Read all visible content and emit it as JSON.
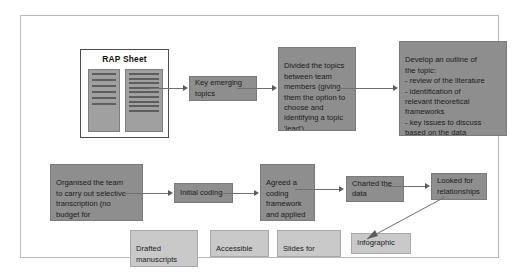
{
  "diagram": {
    "colors": {
      "node_dark": "#8e8e8e",
      "node_light": "#c9c9c9",
      "connector": "#6f6f6f",
      "frame_border": "#b9b9b9",
      "page_background": "#ffffff"
    },
    "document": {
      "label": "RAP Sheet",
      "left_page_lines": 6,
      "right_page_lines": 9
    },
    "rows": {
      "top": [
        {
          "id": "key-emerging-topics",
          "label": "Key emerging\ntopics",
          "style": "dark"
        },
        {
          "id": "divided-topics",
          "label": "Divided the topics\nbetween team\nmembers (giving\nthem the option to\nchoose and\nidentifying a topic\n'lead')",
          "style": "dark"
        },
        {
          "id": "develop-outline",
          "label": "Develop an outline of\nthe topic:\n- review of the literature\n- identification of\n  relevant theoretical\n  frameworks\n- key issues to discuss\n  based on the data",
          "style": "dark"
        }
      ],
      "middle": [
        {
          "id": "organised-team",
          "label": "Organised the team\nto carry out selective\ntranscription (no\nbudget for\ntranscription)",
          "style": "dark"
        },
        {
          "id": "initial-coding",
          "label": "Initial coding",
          "style": "dark"
        },
        {
          "id": "agreed-framework",
          "label": "Agreed a\ncoding\nframework\nand applied\nit to the data",
          "style": "dark"
        },
        {
          "id": "charted-data",
          "label": "Charted the\ndata",
          "style": "dark"
        },
        {
          "id": "looked-relationships",
          "label": "Looked for\nrelationships",
          "style": "dark"
        }
      ],
      "outputs": [
        {
          "id": "drafted-manuscripts",
          "label": "Drafted\nmanuscripts\nfor publication",
          "style": "light"
        },
        {
          "id": "accessible-summaries",
          "label": "Accessible\nsummaries",
          "style": "light"
        },
        {
          "id": "slides-presentations",
          "label": "Slides for\npresentations",
          "style": "light"
        },
        {
          "id": "infographic",
          "label": "Infographic",
          "style": "light"
        }
      ]
    },
    "connectors": [
      {
        "id": "rap-to-key",
        "from": "rap-sheet",
        "to": "key-emerging-topics"
      },
      {
        "id": "key-to-divided",
        "from": "key-emerging-topics",
        "to": "divided-topics"
      },
      {
        "id": "divided-to-develop",
        "from": "divided-topics",
        "to": "develop-outline"
      },
      {
        "id": "organised-to-initial",
        "from": "organised-team",
        "to": "initial-coding"
      },
      {
        "id": "initial-to-agreed",
        "from": "initial-coding",
        "to": "agreed-framework"
      },
      {
        "id": "agreed-to-charted",
        "from": "agreed-framework",
        "to": "charted-data"
      },
      {
        "id": "charted-to-looked",
        "from": "charted-data",
        "to": "looked-relationships"
      },
      {
        "id": "looked-to-infographic",
        "from": "looked-relationships",
        "to": "infographic"
      }
    ]
  }
}
